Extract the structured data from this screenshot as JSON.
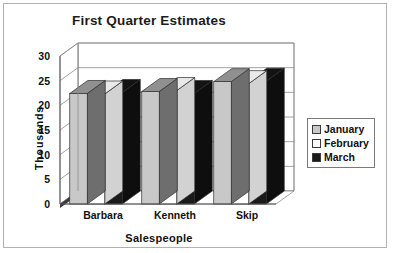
{
  "chart_data": {
    "type": "bar",
    "title": "First Quarter Estimates",
    "xlabel": "Salespeople",
    "ylabel": "Thousands",
    "categories": [
      "Barbara",
      "Kenneth",
      "Skip"
    ],
    "series": [
      {
        "name": "January",
        "values": [
          22.4,
          22.8,
          24.8
        ],
        "color": "#c8c8c8"
      },
      {
        "name": "February",
        "values": [
          22.3,
          23.0,
          24.4
        ],
        "color": "#ffffff"
      },
      {
        "name": "March",
        "values": [
          22.6,
          22.4,
          24.9
        ],
        "color": "#1a1a1a"
      }
    ],
    "ylim": [
      0,
      30
    ],
    "yticks": [
      0,
      5,
      10,
      15,
      20,
      25,
      30
    ],
    "ytick_labels": [
      "0",
      "5",
      "10",
      "15",
      "20",
      "25",
      "30"
    ],
    "grid": true,
    "grid_axis": "y",
    "legend_position": "right",
    "style": "3d-clustered-column",
    "colors": {
      "plot_background": "#ffffff",
      "grid_line": "#8c8c8c",
      "axis_line": "#555555",
      "frame_border": "#b2b2b2",
      "text": "#111111",
      "floor": "#3a3a3a"
    }
  },
  "legend": {
    "items": [
      {
        "label": "January"
      },
      {
        "label": "February"
      },
      {
        "label": "March"
      }
    ]
  }
}
